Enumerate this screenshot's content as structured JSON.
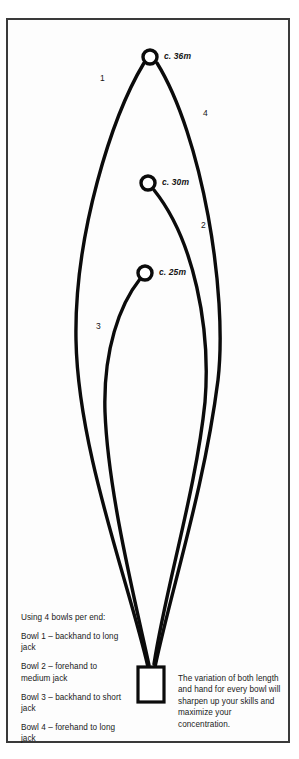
{
  "figure": {
    "background_color": "#ffffff",
    "frame_color": "#3a3a3a",
    "ink_color": "#0b0b0b",
    "jacks": [
      {
        "id": "jack-long",
        "label": "c. 36m",
        "cx": 142,
        "cy": 37,
        "r": 7.0
      },
      {
        "id": "jack-medium",
        "label": "c. 30m",
        "cx": 140,
        "cy": 163,
        "r": 7.0
      },
      {
        "id": "jack-short",
        "label": "c. 25m",
        "cx": 137,
        "cy": 253,
        "r": 7.0
      }
    ],
    "jack_label_positions": [
      {
        "left": 156,
        "top": 32
      },
      {
        "left": 154,
        "top": 158
      },
      {
        "left": 151,
        "top": 248
      }
    ],
    "delivery_curves": [
      {
        "number": "1",
        "hand": "backhand",
        "target": "long jack",
        "label_left": 92,
        "label_top": 54
      },
      {
        "number": "2",
        "hand": "forehand",
        "target": "medium jack",
        "label_left": 193,
        "label_top": 202
      },
      {
        "number": "3",
        "hand": "backhand",
        "target": "short jack",
        "label_left": 88,
        "label_top": 303
      },
      {
        "number": "4",
        "hand": "forehand",
        "target": "long jack",
        "label_left": 195,
        "label_top": 90
      }
    ],
    "mat": {
      "x": 130,
      "y": 647,
      "width": 26,
      "height": 35
    }
  },
  "notes_left": {
    "heading": "Using 4 bowls per end:",
    "lines": [
      "Bowl 1 – backhand to long jack",
      "Bowl 2 – forehand to medium jack",
      "Bowl 3 – backhand to short jack",
      "Bowl 4 – forehand to long jack"
    ]
  },
  "notes_right": {
    "text": "The variation of both length and hand for every bowl will sharpen up your skills and maximize your concentration."
  }
}
